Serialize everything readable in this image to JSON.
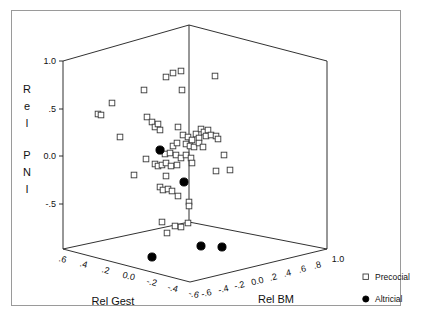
{
  "figure": {
    "background_color": "#ffffff",
    "frame_color": "#9a9a9a",
    "width": 423,
    "height": 324
  },
  "chart_data": {
    "type": "scatter",
    "projection": "3d",
    "title": "",
    "xlabel": "Rel Gest",
    "ylabel": "Rel PNI",
    "zlabel": "Rel BM",
    "grid": false,
    "legend_position": "right",
    "axes": {
      "rel_gest": {
        "label": "Rel Gest",
        "ticks": [
          ".6",
          ".4",
          ".2",
          "0.0",
          "-.2",
          "-.4",
          "-.6"
        ],
        "values": [
          0.6,
          0.4,
          0.2,
          0.0,
          -0.2,
          -0.4,
          -0.6
        ],
        "range": [
          0.6,
          -0.6
        ],
        "direction": "descending-left-to-right"
      },
      "rel_bm": {
        "label": "Rel BM",
        "ticks": [
          "-.6",
          "-.4",
          "-.2",
          "0.0",
          ".2",
          ".4",
          ".6",
          ".8",
          "1.0"
        ],
        "values": [
          -0.6,
          -0.4,
          -0.2,
          0.0,
          0.2,
          0.4,
          0.6,
          0.8,
          1.0
        ],
        "range": [
          -0.6,
          1.0
        ],
        "direction": "ascending-left-to-right"
      },
      "rel_pni": {
        "label": "Rel PNI",
        "label_letters": [
          "R",
          "e",
          "l",
          "P",
          "N",
          "I"
        ],
        "ticks": [
          "1.0",
          ".5",
          "0.0",
          "-.5"
        ],
        "values": [
          1.0,
          0.5,
          0.0,
          -0.5
        ],
        "range": [
          -0.8,
          1.0
        ]
      }
    },
    "series": [
      {
        "name": "Precocial",
        "marker": "open-square",
        "marker_color": "#ffffff",
        "marker_edge_color": "#3b3b3b",
        "count": 62,
        "points": [
          {
            "px": 166,
            "py": 77
          },
          {
            "px": 173,
            "py": 73
          },
          {
            "px": 181,
            "py": 71
          },
          {
            "px": 215,
            "py": 76
          },
          {
            "px": 144,
            "py": 90
          },
          {
            "px": 182,
            "py": 90
          },
          {
            "px": 112,
            "py": 103
          },
          {
            "px": 98,
            "py": 114
          },
          {
            "px": 101,
            "py": 115
          },
          {
            "px": 147,
            "py": 117
          },
          {
            "px": 152,
            "py": 122
          },
          {
            "px": 155,
            "py": 127
          },
          {
            "px": 158,
            "py": 124
          },
          {
            "px": 160,
            "py": 130
          },
          {
            "px": 120,
            "py": 137
          },
          {
            "px": 178,
            "py": 127
          },
          {
            "px": 183,
            "py": 135
          },
          {
            "px": 188,
            "py": 137
          },
          {
            "px": 192,
            "py": 140
          },
          {
            "px": 196,
            "py": 134
          },
          {
            "px": 199,
            "py": 138
          },
          {
            "px": 201,
            "py": 129
          },
          {
            "px": 204,
            "py": 132
          },
          {
            "px": 206,
            "py": 136
          },
          {
            "px": 208,
            "py": 130
          },
          {
            "px": 211,
            "py": 135
          },
          {
            "px": 216,
            "py": 136
          },
          {
            "px": 218,
            "py": 139
          },
          {
            "px": 173,
            "py": 146
          },
          {
            "px": 177,
            "py": 143
          },
          {
            "px": 186,
            "py": 144
          },
          {
            "px": 190,
            "py": 146
          },
          {
            "px": 194,
            "py": 147
          },
          {
            "px": 199,
            "py": 143
          },
          {
            "px": 203,
            "py": 147
          },
          {
            "px": 161,
            "py": 151
          },
          {
            "px": 165,
            "py": 154
          },
          {
            "px": 170,
            "py": 153
          },
          {
            "px": 176,
            "py": 155
          },
          {
            "px": 181,
            "py": 158
          },
          {
            "px": 186,
            "py": 155
          },
          {
            "px": 191,
            "py": 158
          },
          {
            "px": 146,
            "py": 159
          },
          {
            "px": 155,
            "py": 164
          },
          {
            "px": 158,
            "py": 166
          },
          {
            "px": 162,
            "py": 165
          },
          {
            "px": 166,
            "py": 163
          },
          {
            "px": 171,
            "py": 166
          },
          {
            "px": 177,
            "py": 165
          },
          {
            "px": 192,
            "py": 163
          },
          {
            "px": 224,
            "py": 155
          },
          {
            "px": 216,
            "py": 171
          },
          {
            "px": 230,
            "py": 170
          },
          {
            "px": 134,
            "py": 175
          },
          {
            "px": 166,
            "py": 176
          },
          {
            "px": 160,
            "py": 187
          },
          {
            "px": 163,
            "py": 190
          },
          {
            "px": 168,
            "py": 189
          },
          {
            "px": 172,
            "py": 191
          },
          {
            "px": 178,
            "py": 196
          },
          {
            "px": 189,
            "py": 202
          },
          {
            "px": 189,
            "py": 206
          },
          {
            "px": 162,
            "py": 222
          },
          {
            "px": 175,
            "py": 226
          },
          {
            "px": 181,
            "py": 227
          },
          {
            "px": 188,
            "py": 223
          },
          {
            "px": 167,
            "py": 233
          }
        ]
      },
      {
        "name": "Altricial",
        "marker": "filled-circle",
        "marker_color": "#000000",
        "marker_edge_color": "#000000",
        "count": 6,
        "points": [
          {
            "px": 160,
            "py": 150
          },
          {
            "px": 184,
            "py": 182
          },
          {
            "px": 152,
            "py": 257
          },
          {
            "px": 201,
            "py": 246
          },
          {
            "px": 222,
            "py": 247
          }
        ]
      }
    ]
  },
  "legend": {
    "entries": [
      {
        "label": "Precocial",
        "marker": "open-square"
      },
      {
        "label": "Altricial",
        "marker": "filled-circle"
      }
    ]
  }
}
